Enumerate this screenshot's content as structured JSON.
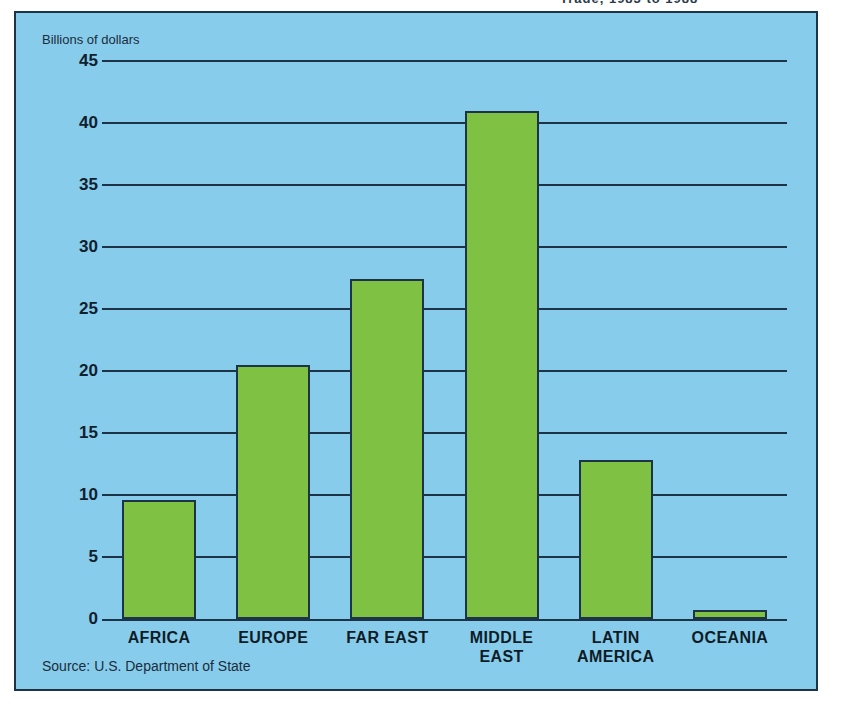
{
  "top_cutoff_text": "Trade, 1983 to 1988",
  "figure": {
    "axis_caption": "Billions of dollars",
    "source_note": "Source: U.S. Department of State",
    "background_color": "#87cdeb",
    "bar_color": "#7fc142",
    "line_color": "#1d3347"
  },
  "chart_data": {
    "type": "bar",
    "title": "",
    "xlabel": "",
    "ylabel": "Billions of dollars",
    "categories": [
      "AFRICA",
      "EUROPE",
      "FAR EAST",
      "MIDDLE EAST",
      "LATIN AMERICA",
      "OCEANIA"
    ],
    "category_lines": [
      [
        "AFRICA"
      ],
      [
        "EUROPE"
      ],
      [
        "FAR EAST"
      ],
      [
        "MIDDLE",
        "EAST"
      ],
      [
        "LATIN",
        "AMERICA"
      ],
      [
        "OCEANIA"
      ]
    ],
    "values": [
      9.6,
      20.5,
      27.4,
      41.0,
      12.8,
      0.7
    ],
    "ylim": [
      0,
      45
    ],
    "yticks": [
      0,
      5,
      10,
      15,
      20,
      25,
      30,
      35,
      40,
      45
    ],
    "grid": true,
    "legend": "none"
  }
}
